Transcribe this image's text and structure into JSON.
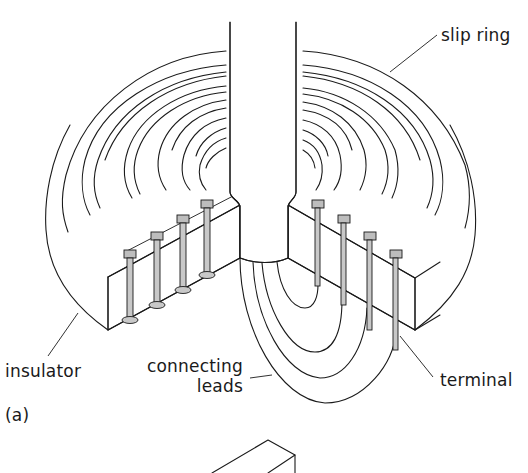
{
  "figure": {
    "panel_label": "(a)",
    "labels": {
      "slip_ring": "slip ring",
      "insulator": "insulator",
      "connecting_leads_line1": "connecting",
      "connecting_leads_line2": "leads",
      "terminal": "terminal"
    },
    "ring_count": 4,
    "terminal_count_left": 4,
    "terminal_count_right": 4,
    "colors": {
      "ink": "#1a1a1a",
      "pin_fill": "#c8c8c8",
      "background": "#ffffff"
    }
  }
}
